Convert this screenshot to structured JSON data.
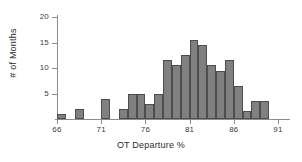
{
  "chart_data": {
    "type": "bar",
    "title": "",
    "xlabel": "OT Departure %",
    "ylabel": "# of Months",
    "xlim": [
      66,
      91
    ],
    "ylim": [
      0,
      20
    ],
    "xticks": [
      66,
      71,
      76,
      81,
      86,
      91
    ],
    "yticks": [
      0,
      5,
      10,
      15,
      20
    ],
    "grid": false,
    "legend": null,
    "bar_color": "#808080",
    "bar_edge_color": "#4d4d4d",
    "bin_width": 1,
    "categories": [
      "66-67",
      "67-68",
      "68-69",
      "69-70",
      "70-71",
      "71-72",
      "72-73",
      "73-74",
      "74-75",
      "75-76",
      "76-77",
      "77-78",
      "78-79",
      "79-80",
      "80-81",
      "81-82",
      "82-83",
      "83-84",
      "84-85",
      "85-86",
      "86-87",
      "87-88",
      "88-89",
      "89-90",
      "90-91"
    ],
    "bin_starts": [
      66,
      67,
      68,
      69,
      70,
      71,
      72,
      73,
      74,
      75,
      76,
      77,
      78,
      79,
      80,
      81,
      82,
      83,
      84,
      85,
      86,
      87,
      88,
      89,
      90
    ],
    "values": [
      1,
      0,
      2,
      0,
      0,
      4,
      0,
      2,
      5,
      5,
      3,
      5,
      11.5,
      10.5,
      12.5,
      15.5,
      14.5,
      10.5,
      9.5,
      11.5,
      6.5,
      1.5,
      3.5,
      3.5,
      0
    ]
  },
  "axis": {
    "x_tick_labels": [
      "66",
      "71",
      "76",
      "81",
      "86",
      "91"
    ],
    "y_tick_labels": [
      "0",
      "5",
      "10",
      "15",
      "20"
    ]
  }
}
